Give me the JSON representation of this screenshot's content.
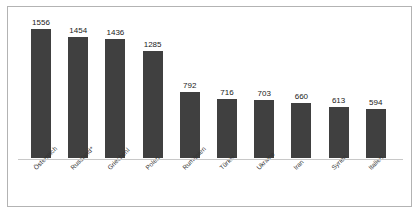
{
  "chart_data": {
    "type": "bar",
    "title": "",
    "subtitle": "",
    "xlabel": "",
    "ylabel": "",
    "grid": false,
    "legend": "none",
    "orientation": "vertical",
    "ylim": [
      0,
      1556
    ],
    "bar_color": "#404040",
    "background_color": "#ffffff",
    "frame_color": "#b3b3b3",
    "categories": [
      "Österreich",
      "Russland*",
      "Griechenl",
      "Polen",
      "Rumänien",
      "Türkei",
      "Ukraine",
      "Iran",
      "Syrien",
      "Italien"
    ],
    "values": [
      1556,
      1454,
      1436,
      1285,
      792,
      716,
      703,
      660,
      613,
      594
    ],
    "data_labels": [
      "1556",
      "1454",
      "1436",
      "1285",
      "792",
      "716",
      "703",
      "660",
      "613",
      "594"
    ]
  }
}
